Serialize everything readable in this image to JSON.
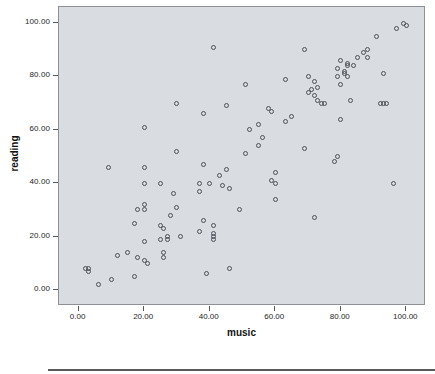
{
  "chart_data": {
    "type": "scatter",
    "title": "",
    "xlabel": "music",
    "ylabel": "reading",
    "xlim": [
      -6,
      106
    ],
    "ylim": [
      -6,
      106
    ],
    "grid": false,
    "legend": null,
    "xticks": [
      "0.00",
      "20.00",
      "40.00",
      "60.00",
      "80.00",
      "100.00"
    ],
    "xtick_values": [
      0,
      20,
      40,
      60,
      80,
      100
    ],
    "yticks": [
      "0.00",
      "20.00",
      "40.00",
      "60.00",
      "80.00",
      "100.00"
    ],
    "ytick_values": [
      0,
      20,
      40,
      60,
      80,
      100
    ],
    "marker": "open-circle",
    "marker_color": "#4a4f57",
    "plot_background": "#d9dde1",
    "series": [
      {
        "name": "reading vs music",
        "x": [
          2,
          3,
          3,
          6,
          9,
          10,
          12,
          15,
          17,
          17,
          18,
          18,
          20,
          20,
          20,
          20,
          20,
          20,
          20,
          21,
          25,
          25,
          25,
          26,
          26,
          26,
          27,
          27,
          28,
          29,
          30,
          30,
          30,
          31,
          37,
          37,
          37,
          38,
          38,
          38,
          39,
          40,
          41,
          41,
          41,
          41,
          41,
          43,
          44,
          45,
          45,
          46,
          46,
          49,
          51,
          51,
          52,
          55,
          55,
          56,
          58,
          59,
          59,
          60,
          60,
          60,
          63,
          63,
          65,
          69,
          69,
          70,
          70,
          71,
          72,
          72,
          72,
          73,
          73,
          74,
          75,
          78,
          79,
          79,
          79,
          80,
          80,
          80,
          81,
          81,
          82,
          82,
          82,
          83,
          84,
          85,
          87,
          88,
          88,
          91,
          92,
          93,
          93,
          94,
          96,
          97,
          99,
          100
        ],
        "y": [
          8,
          8,
          7,
          2,
          46,
          4,
          13,
          14,
          25,
          5,
          12,
          30,
          61,
          46,
          40,
          32,
          30,
          18,
          11,
          10,
          40,
          24,
          19,
          23,
          14,
          12,
          20,
          19,
          28,
          36,
          70,
          52,
          31,
          20,
          40,
          37,
          22,
          66,
          47,
          26,
          6,
          40,
          91,
          24,
          21,
          20,
          19,
          43,
          39,
          69,
          45,
          8,
          38,
          30,
          77,
          51,
          60,
          62,
          54,
          57,
          68,
          67,
          41,
          44,
          34,
          40,
          79,
          63,
          65,
          90,
          53,
          80,
          74,
          75,
          78,
          73,
          27,
          76,
          71,
          70,
          70,
          48,
          83,
          80,
          50,
          86,
          77,
          64,
          82,
          81,
          85,
          84,
          80,
          71,
          84,
          87,
          89,
          90,
          87,
          95,
          70,
          70,
          81,
          70,
          40,
          98,
          100,
          99
        ]
      }
    ]
  },
  "axis": {
    "x_title": "music",
    "y_title": "reading"
  }
}
